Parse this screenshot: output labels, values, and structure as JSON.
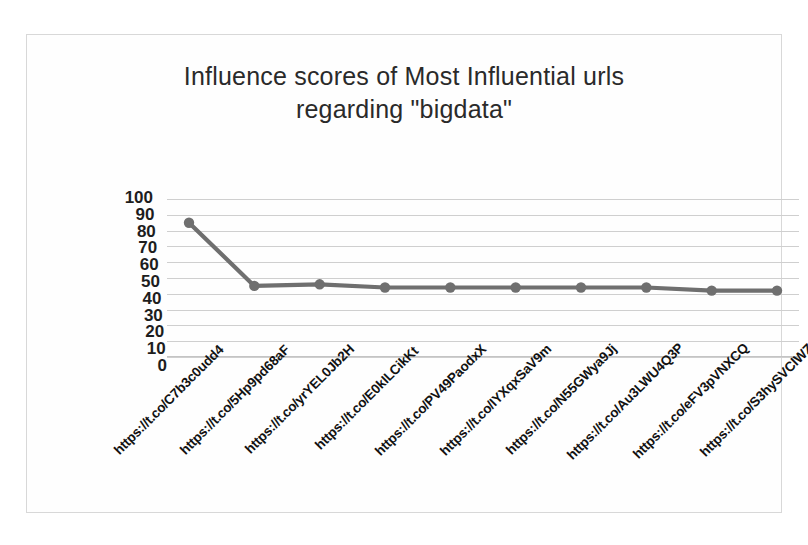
{
  "chart_data": {
    "type": "line",
    "title": "Influence scores of Most Influential urls regarding \"bigdata\"",
    "title_lines": [
      "Influence scores of Most Influential urls",
      "regarding \"bigdata\""
    ],
    "xlabel": "",
    "ylabel": "",
    "ylim": [
      0,
      100
    ],
    "ytick_step": 10,
    "yticks": [
      "100",
      "90",
      "80",
      "70",
      "60",
      "50",
      "40",
      "30",
      "20",
      "10",
      "0"
    ],
    "grid": true,
    "legend": false,
    "legend_position": "none",
    "series_color": "#6f6f6f",
    "gridline_color": "#cfcfcf",
    "marker": "circle",
    "categories": [
      "https://t.co/C7b3c0udd4",
      "https://t.co/5Hp9pd68aF",
      "https://t.co/yrYEL0Jb2H",
      "https://t.co/E0kILCikKt",
      "https://t.co/PV49PaodxX",
      "https://t.co/IYXqxSaV9m",
      "https://t.co/N55GWya9Jj",
      "https://t.co/Au3LWU4Q3P",
      "https://t.co/eFV3pVNXCQ",
      "https://t.co/S3hySVClWZ"
    ],
    "values": [
      85,
      45,
      46,
      44,
      44,
      44,
      44,
      44,
      42,
      42
    ]
  }
}
